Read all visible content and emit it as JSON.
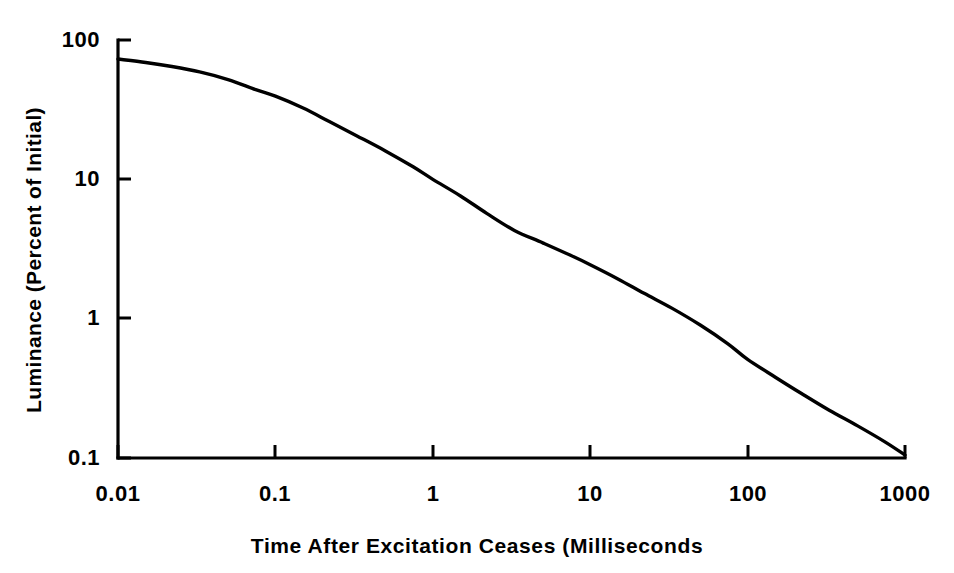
{
  "chart_data": {
    "type": "line",
    "title": "",
    "xlabel": "Time After Excitation Ceases (Milliseconds",
    "ylabel": "Luminance (Percent of Initial)",
    "xscale": "log",
    "yscale": "log",
    "xlim": [
      0.01,
      1000
    ],
    "ylim": [
      0.1,
      100
    ],
    "grid": false,
    "legend": "none",
    "xticks": [
      {
        "value": 0.01,
        "label": "0.01"
      },
      {
        "value": 0.1,
        "label": "0.1"
      },
      {
        "value": 1,
        "label": "1"
      },
      {
        "value": 10,
        "label": "10"
      },
      {
        "value": 100,
        "label": "100"
      },
      {
        "value": 1000,
        "label": "1000"
      }
    ],
    "yticks": [
      {
        "value": 100,
        "label": "100"
      },
      {
        "value": 10,
        "label": "10"
      },
      {
        "value": 1,
        "label": "1"
      },
      {
        "value": 0.1,
        "label": "0.1"
      }
    ],
    "series": [
      {
        "name": "Phosphor luminance decay",
        "color": "#000000",
        "x": [
          0.01,
          0.015,
          0.022,
          0.033,
          0.05,
          0.075,
          0.1,
          0.15,
          0.22,
          0.33,
          0.5,
          0.75,
          1.0,
          1.5,
          2.2,
          3.3,
          5.0,
          7.5,
          10,
          15,
          22,
          33,
          50,
          75,
          100,
          150,
          220,
          330,
          500,
          750,
          1000
        ],
        "y": [
          73,
          69,
          64.5,
          59,
          52,
          44,
          39.5,
          32.5,
          26,
          20.5,
          16,
          12.3,
          10.0,
          7.6,
          5.7,
          4.3,
          3.5,
          2.85,
          2.44,
          1.93,
          1.52,
          1.19,
          0.9,
          0.66,
          0.51,
          0.38,
          0.29,
          0.22,
          0.17,
          0.13,
          0.105
        ]
      }
    ]
  },
  "chart_meta": {
    "background_color": "#ffffff",
    "axis_color": "#000000",
    "line_color": "#000000"
  }
}
